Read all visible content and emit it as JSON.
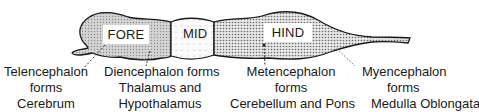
{
  "diagram": {
    "regions": {
      "fore": {
        "label": "FORE",
        "fill": "#cfcfcf"
      },
      "mid": {
        "label": "MID",
        "fill": "#f2f2f2"
      },
      "hind": {
        "label": "HIND",
        "fill": "#d8d8d8"
      }
    },
    "captions": [
      {
        "id": "telencephalon",
        "lines": [
          "Telencephalon",
          "forms",
          "Cerebrum"
        ]
      },
      {
        "id": "diencephalon",
        "lines": [
          "Diencephalon forms",
          "Thalamus and",
          "Hypothalamus"
        ]
      },
      {
        "id": "metencephalon",
        "lines": [
          "Metencephalon",
          "forms",
          "Cerebellum and Pons"
        ]
      },
      {
        "id": "myencephalon",
        "lines": [
          "Myencephalon",
          "forms",
          "Medulla Oblongata"
        ]
      }
    ],
    "colors": {
      "outline": "#1a1a1a",
      "text": "#1a1a1a",
      "background": "#ffffff"
    }
  }
}
